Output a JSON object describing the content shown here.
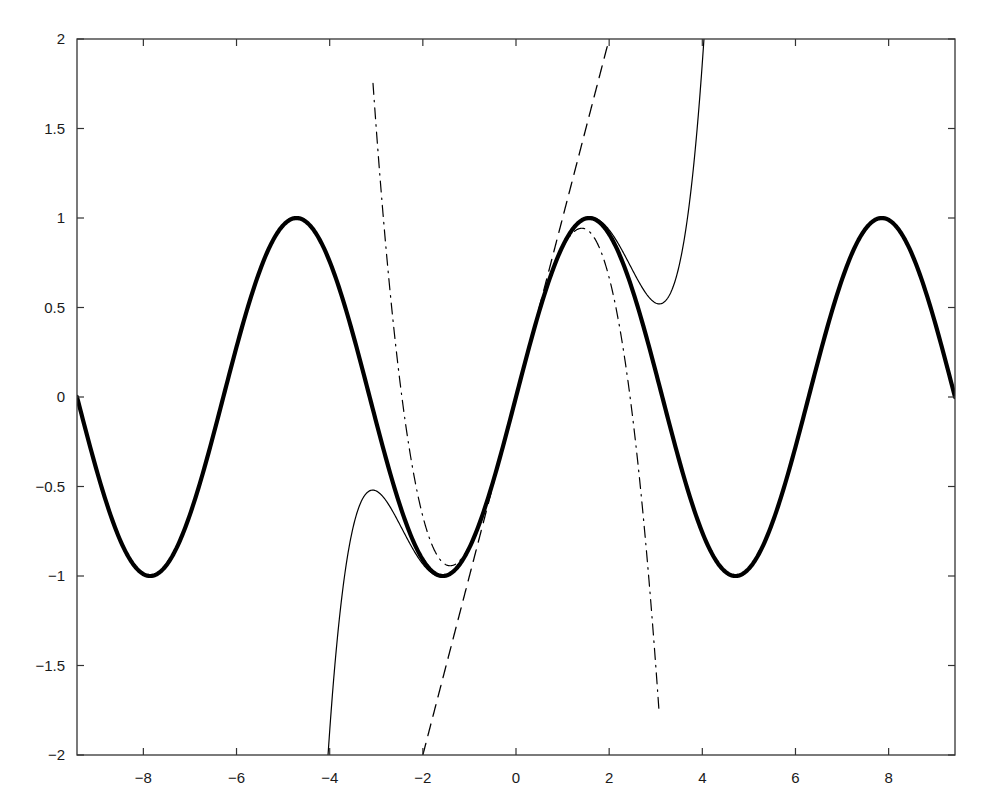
{
  "chart_data": {
    "type": "line",
    "title": "",
    "xlabel": "",
    "ylabel": "",
    "xlim": [
      -9.42477796,
      9.42477796
    ],
    "ylim": [
      -2,
      2
    ],
    "grid": false,
    "legend": null,
    "xticks": [
      -8,
      -6,
      -4,
      -2,
      0,
      2,
      4,
      6,
      8
    ],
    "xtick_labels": [
      "−8",
      "−6",
      "−4",
      "−2",
      "0",
      "2",
      "4",
      "6",
      "8"
    ],
    "yticks": [
      -2,
      -1.5,
      -1,
      -0.5,
      0,
      0.5,
      1,
      1.5,
      2
    ],
    "ytick_labels": [
      "−2",
      "−1.5",
      "−1",
      "−0.5",
      "0",
      "0.5",
      "1",
      "1.5",
      "2"
    ],
    "series": [
      {
        "name": "sin(x)",
        "style": "solid-thick",
        "color": "#000000",
        "x": [
          -9.4248,
          -8.6394,
          -7.854,
          -7.0686,
          -6.2832,
          -5.4978,
          -4.7124,
          -3.927,
          -3.1416,
          -2.3562,
          -1.5708,
          -0.7854,
          0,
          0.7854,
          1.5708,
          2.3562,
          3.1416,
          3.927,
          4.7124,
          5.4978,
          6.2832,
          7.0686,
          7.854,
          8.6394,
          9.4248
        ],
        "y": [
          0,
          -0.7071,
          -1,
          -0.7071,
          0,
          0.7071,
          1,
          0.7071,
          0,
          -0.7071,
          -1,
          -0.7071,
          0,
          0.7071,
          1,
          0.7071,
          0,
          -0.7071,
          -1,
          -0.7071,
          0,
          0.7071,
          1,
          0.7071,
          0
        ]
      },
      {
        "name": "x",
        "style": "dashed",
        "color": "#000000",
        "x": [
          -2,
          -1,
          0,
          1,
          2
        ],
        "y": [
          -2,
          -1,
          0,
          1,
          2
        ]
      },
      {
        "name": "x - x^3/6",
        "style": "dashdot",
        "color": "#000000",
        "x": [
          -3.07,
          -2.5,
          -2,
          -1.5,
          -1.414,
          -1,
          -0.5,
          0,
          0.5,
          1,
          1.414,
          1.5,
          2,
          2.5,
          3.07
        ],
        "y": [
          2.0,
          0.104,
          -0.667,
          -0.938,
          -0.943,
          -0.833,
          -0.479,
          0,
          0.479,
          0.833,
          0.943,
          0.938,
          0.667,
          -0.104,
          -2.0
        ]
      },
      {
        "name": "x - x^3/6 + x^5/120",
        "style": "solid-thin",
        "color": "#000000",
        "x": [
          -4.05,
          -3.5,
          -3.05,
          -2.5,
          -2,
          -1.5,
          -1,
          -0.5,
          0,
          0.5,
          1,
          1.5,
          2,
          2.5,
          3.05,
          3.5,
          4.05
        ],
        "y": [
          -2.0,
          -0.647,
          -0.524,
          -0.711,
          -0.933,
          -1.001,
          -0.842,
          -0.479,
          0,
          0.479,
          0.842,
          1.001,
          0.933,
          0.711,
          0.524,
          0.647,
          2.0
        ]
      }
    ]
  }
}
